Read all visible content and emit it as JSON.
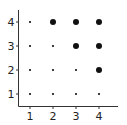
{
  "chart_data": {
    "type": "scatter",
    "title": "",
    "xlabel": "",
    "ylabel": "",
    "x_ticks": [
      "1",
      "2",
      "3",
      "4"
    ],
    "y_ticks": [
      "1",
      "2",
      "3",
      "4"
    ],
    "xlim": [
      0.5,
      4.8
    ],
    "ylim": [
      0.5,
      4.5
    ],
    "grid": false,
    "legend": null,
    "points": [
      {
        "x": 1,
        "y": 1,
        "size": "small"
      },
      {
        "x": 2,
        "y": 1,
        "size": "small"
      },
      {
        "x": 3,
        "y": 1,
        "size": "small"
      },
      {
        "x": 4,
        "y": 1,
        "size": "small"
      },
      {
        "x": 1,
        "y": 2,
        "size": "small"
      },
      {
        "x": 2,
        "y": 2,
        "size": "small"
      },
      {
        "x": 3,
        "y": 2,
        "size": "small"
      },
      {
        "x": 4,
        "y": 2,
        "size": "large"
      },
      {
        "x": 1,
        "y": 3,
        "size": "small"
      },
      {
        "x": 2,
        "y": 3,
        "size": "small"
      },
      {
        "x": 3,
        "y": 3,
        "size": "large"
      },
      {
        "x": 4,
        "y": 3,
        "size": "large"
      },
      {
        "x": 1,
        "y": 4,
        "size": "small"
      },
      {
        "x": 2,
        "y": 4,
        "size": "large"
      },
      {
        "x": 3,
        "y": 4,
        "size": "large"
      },
      {
        "x": 4,
        "y": 4,
        "size": "large"
      }
    ],
    "colors": {
      "marker": "#111111",
      "axis": "#333333"
    }
  }
}
